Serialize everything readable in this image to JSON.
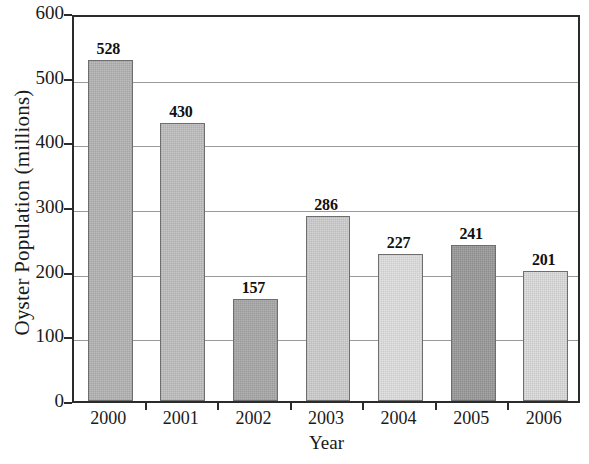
{
  "chart_data": {
    "type": "bar",
    "title": "",
    "xlabel": "Year",
    "ylabel": "Oyster Population (millions)",
    "categories": [
      "2000",
      "2001",
      "2002",
      "2003",
      "2004",
      "2005",
      "2006"
    ],
    "values": [
      528,
      430,
      157,
      286,
      227,
      241,
      201
    ],
    "value_labels": [
      "528",
      "430",
      "157",
      "286",
      "227",
      "241",
      "201"
    ],
    "bar_colors": [
      "#b5b5b5",
      "#c0c0c0",
      "#aaaaaa",
      "#cfcfcf",
      "#e0e0e0",
      "#9b9b9b",
      "#dcdcdc"
    ],
    "ylim": [
      0,
      600
    ],
    "ytick_labels": [
      "0",
      "100",
      "200",
      "300",
      "400",
      "500",
      "600"
    ],
    "ytick_values": [
      0,
      100,
      200,
      300,
      400,
      500,
      600
    ],
    "grid": true,
    "legend": false,
    "legend_position": "none",
    "axis_color": "#2b2b2b",
    "grid_color": "#9a9a9a"
  }
}
